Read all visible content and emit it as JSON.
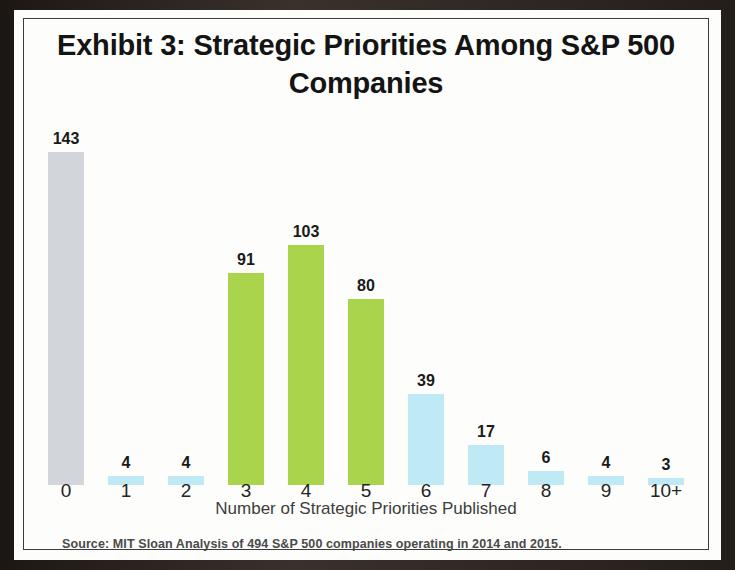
{
  "exhibit": {
    "title": "Exhibit 3: Strategic Priorities Among S&P 500 Companies",
    "axis_title": "Number of Strategic Priorities Published",
    "source_note": "Source: MIT Sloan Analysis of 494 S&P 500 companies operating in 2014 and 2015."
  },
  "colors": {
    "gray": "#d2d5da",
    "green": "#a9d44b",
    "blue": "#c0e9f6",
    "text": "#141414",
    "border": "#3b3b3b",
    "paper": "#fdfdfb"
  },
  "chart_data": {
    "type": "bar",
    "title": "Exhibit 3: Strategic Priorities Among S&P 500 Companies",
    "xlabel": "Number of Strategic Priorities Published",
    "ylabel": "",
    "categories": [
      "0",
      "1",
      "2",
      "3",
      "4",
      "5",
      "6",
      "7",
      "8",
      "9",
      "10+"
    ],
    "values": [
      143,
      4,
      4,
      91,
      103,
      80,
      39,
      17,
      6,
      4,
      3
    ],
    "value_labels": [
      "143",
      "4",
      "4",
      "91",
      "103",
      "80",
      "39",
      "17",
      "6",
      "4",
      "3"
    ],
    "bar_colors": [
      "gray",
      "blue",
      "blue",
      "green",
      "green",
      "green",
      "blue",
      "blue",
      "blue",
      "blue",
      "blue"
    ],
    "ylim": [
      0,
      143
    ],
    "grid": false,
    "legend": "none",
    "source": "Source: MIT Sloan Analysis of 494 S&P 500 companies operating in 2014 and 2015."
  }
}
